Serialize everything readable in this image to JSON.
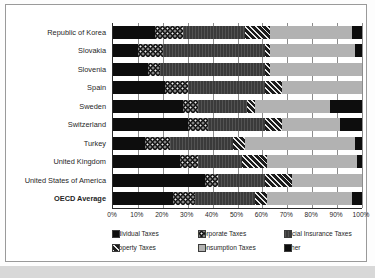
{
  "chart_data": {
    "type": "bar",
    "orientation": "horizontal",
    "stacked": true,
    "title": "",
    "xlabel": "",
    "ylabel": "",
    "xlim": [
      0,
      100
    ],
    "xticks": [
      0,
      10,
      20,
      30,
      40,
      50,
      60,
      70,
      80,
      90,
      100
    ],
    "xtick_labels": [
      "0%",
      "10%",
      "20%",
      "30%",
      "40%",
      "50%",
      "60%",
      "70%",
      "80%",
      "90%",
      "100%"
    ],
    "grid": true,
    "legend_position": "bottom",
    "categories": [
      "Republic of Korea",
      "Slovakia",
      "Slovenia",
      "Spain",
      "Sweden",
      "Switzerland",
      "Turkey",
      "United Kingdom",
      "United States of America",
      "OECD Average"
    ],
    "emphasized_category": "OECD Average",
    "series": [
      {
        "name": "Individual Taxes",
        "pattern": "solid-black",
        "color": "#0d0d0d",
        "values": [
          17,
          10,
          14,
          21,
          28,
          30,
          13,
          27,
          37,
          24
        ]
      },
      {
        "name": "Corporate Taxes",
        "pattern": "dotted",
        "color": "#141414",
        "values": [
          11,
          10,
          5,
          9,
          6,
          8,
          10,
          7,
          5,
          9
        ]
      },
      {
        "name": "Social Insurance Taxes",
        "pattern": "fine-vertical",
        "color": "#3a3a3a",
        "values": [
          25,
          41,
          42,
          31,
          20,
          23,
          25,
          18,
          19,
          24
        ]
      },
      {
        "name": "Property Taxes",
        "pattern": "diagonal-hatch",
        "color": "#1c1c1c",
        "values": [
          10,
          2,
          2,
          7,
          3,
          7,
          5,
          10,
          11,
          5
        ]
      },
      {
        "name": "Consumption Taxes",
        "pattern": "solid-light-gray",
        "color": "#b2b2b2",
        "values": [
          33,
          34,
          37,
          32,
          30,
          23,
          44,
          36,
          28,
          34
        ]
      },
      {
        "name": "Other",
        "pattern": "solid-black",
        "color": "#0d0d0d",
        "values": [
          4,
          3,
          0,
          0,
          13,
          9,
          3,
          2,
          0,
          4
        ]
      }
    ]
  },
  "legend": {
    "items": [
      {
        "label": "Individual Taxes",
        "key": "individual"
      },
      {
        "label": "Corporate Taxes",
        "key": "corporate"
      },
      {
        "label": "Social Insurance Taxes",
        "key": "social"
      },
      {
        "label": "Property Taxes",
        "key": "property"
      },
      {
        "label": "Consumption Taxes",
        "key": "consumption"
      },
      {
        "label": "Other",
        "key": "other"
      }
    ]
  },
  "caption": {
    "text": ""
  }
}
